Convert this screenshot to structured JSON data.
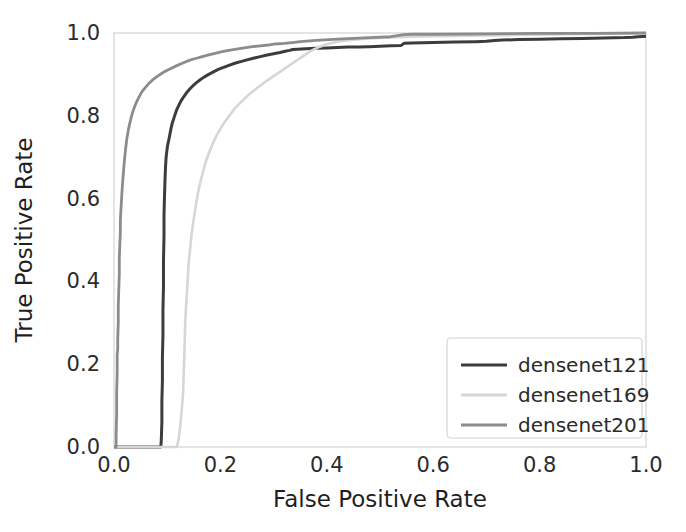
{
  "chart_data": {
    "type": "line",
    "title": "",
    "xlabel": "False Positive Rate",
    "ylabel": "True Positive Rate",
    "xlim": [
      0.0,
      1.0
    ],
    "ylim": [
      0.0,
      1.0
    ],
    "xticks": [
      "0.0",
      "0.2",
      "0.4",
      "0.6",
      "0.8",
      "1.0"
    ],
    "yticks": [
      "0.0",
      "0.2",
      "0.4",
      "0.6",
      "0.8",
      "1.0"
    ],
    "xtick_values": [
      0.0,
      0.2,
      0.4,
      0.6,
      0.8,
      1.0
    ],
    "ytick_values": [
      0.0,
      0.2,
      0.4,
      0.6,
      0.8,
      1.0
    ],
    "grid": false,
    "legend_position": "lower right",
    "series": [
      {
        "name": "densenet121",
        "color": "#3c3c3c",
        "linewidth": 3.0,
        "x": [
          0.0,
          0.088,
          0.089,
          0.09,
          0.09,
          0.091,
          0.091,
          0.092,
          0.092,
          0.093,
          0.093,
          0.094,
          0.094,
          0.095,
          0.096,
          0.097,
          0.098,
          0.099,
          0.1,
          0.101,
          0.103,
          0.105,
          0.107,
          0.109,
          0.112,
          0.115,
          0.118,
          0.122,
          0.126,
          0.131,
          0.136,
          0.142,
          0.148,
          0.155,
          0.162,
          0.17,
          0.178,
          0.187,
          0.196,
          0.206,
          0.216,
          0.227,
          0.238,
          0.25,
          0.262,
          0.275,
          0.288,
          0.3,
          0.312,
          0.322,
          0.33,
          0.336,
          0.345,
          0.36,
          0.38,
          0.4,
          0.42,
          0.44,
          0.46,
          0.48,
          0.5,
          0.52,
          0.54,
          0.545,
          0.56,
          0.6,
          0.64,
          0.68,
          0.7,
          0.715,
          0.73,
          0.76,
          0.8,
          0.84,
          0.88,
          0.92,
          0.96,
          0.975,
          0.985,
          1.0
        ],
        "y": [
          0.0,
          0.0,
          0.02,
          0.06,
          0.11,
          0.16,
          0.215,
          0.27,
          0.33,
          0.39,
          0.45,
          0.51,
          0.56,
          0.61,
          0.65,
          0.68,
          0.7,
          0.712,
          0.722,
          0.73,
          0.742,
          0.755,
          0.768,
          0.78,
          0.792,
          0.804,
          0.815,
          0.826,
          0.836,
          0.846,
          0.855,
          0.864,
          0.872,
          0.88,
          0.887,
          0.894,
          0.9,
          0.906,
          0.912,
          0.917,
          0.922,
          0.927,
          0.931,
          0.935,
          0.939,
          0.943,
          0.947,
          0.95,
          0.953,
          0.956,
          0.958,
          0.96,
          0.961,
          0.962,
          0.963,
          0.964,
          0.965,
          0.966,
          0.966,
          0.967,
          0.968,
          0.969,
          0.97,
          0.975,
          0.976,
          0.977,
          0.978,
          0.979,
          0.98,
          0.982,
          0.983,
          0.984,
          0.985,
          0.986,
          0.987,
          0.988,
          0.989,
          0.99,
          0.991,
          0.992
        ]
      },
      {
        "name": "densenet169",
        "color": "#d6d6d6",
        "linewidth": 2.6,
        "x": [
          0.0,
          0.118,
          0.12,
          0.122,
          0.124,
          0.126,
          0.128,
          0.13,
          0.131,
          0.132,
          0.133,
          0.134,
          0.136,
          0.138,
          0.14,
          0.143,
          0.146,
          0.15,
          0.154,
          0.158,
          0.163,
          0.168,
          0.173,
          0.179,
          0.185,
          0.191,
          0.198,
          0.205,
          0.212,
          0.219,
          0.226,
          0.234,
          0.242,
          0.25,
          0.258,
          0.266,
          0.274,
          0.282,
          0.29,
          0.298,
          0.306,
          0.314,
          0.322,
          0.33,
          0.338,
          0.346,
          0.354,
          0.362,
          0.372,
          0.385,
          0.4,
          0.42,
          0.45,
          0.48,
          0.52,
          0.56,
          0.6,
          0.65,
          0.7,
          0.75,
          0.8,
          0.85,
          0.9,
          0.95,
          1.0
        ],
        "y": [
          0.0,
          0.0,
          0.01,
          0.025,
          0.045,
          0.07,
          0.1,
          0.135,
          0.175,
          0.215,
          0.26,
          0.305,
          0.35,
          0.395,
          0.437,
          0.478,
          0.516,
          0.552,
          0.585,
          0.615,
          0.643,
          0.668,
          0.691,
          0.712,
          0.731,
          0.748,
          0.764,
          0.779,
          0.792,
          0.804,
          0.816,
          0.827,
          0.837,
          0.847,
          0.856,
          0.864,
          0.872,
          0.88,
          0.887,
          0.894,
          0.901,
          0.908,
          0.915,
          0.922,
          0.929,
          0.936,
          0.943,
          0.95,
          0.958,
          0.966,
          0.973,
          0.979,
          0.984,
          0.987,
          0.989,
          0.991,
          0.992,
          0.993,
          0.994,
          0.995,
          0.996,
          0.997,
          0.998,
          0.999,
          1.0
        ]
      },
      {
        "name": "densenet201",
        "color": "#8c8c8c",
        "linewidth": 2.8,
        "x": [
          0.0,
          0.004,
          0.004,
          0.005,
          0.005,
          0.006,
          0.006,
          0.007,
          0.007,
          0.008,
          0.008,
          0.009,
          0.01,
          0.01,
          0.011,
          0.012,
          0.012,
          0.013,
          0.014,
          0.015,
          0.016,
          0.017,
          0.018,
          0.019,
          0.02,
          0.021,
          0.022,
          0.023,
          0.024,
          0.025,
          0.027,
          0.029,
          0.031,
          0.033,
          0.035,
          0.037,
          0.04,
          0.043,
          0.046,
          0.049,
          0.052,
          0.056,
          0.06,
          0.064,
          0.068,
          0.072,
          0.077,
          0.082,
          0.088,
          0.094,
          0.1,
          0.108,
          0.116,
          0.125,
          0.134,
          0.144,
          0.155,
          0.166,
          0.178,
          0.19,
          0.203,
          0.216,
          0.23,
          0.245,
          0.26,
          0.275,
          0.29,
          0.3,
          0.31,
          0.32,
          0.335,
          0.35,
          0.38,
          0.42,
          0.47,
          0.52,
          0.545,
          0.56,
          0.6,
          0.7,
          0.8,
          0.9,
          1.0
        ],
        "y": [
          0.0,
          0.0,
          0.03,
          0.08,
          0.13,
          0.18,
          0.225,
          0.235,
          0.26,
          0.3,
          0.34,
          0.38,
          0.42,
          0.455,
          0.49,
          0.52,
          0.548,
          0.572,
          0.595,
          0.616,
          0.635,
          0.652,
          0.668,
          0.683,
          0.697,
          0.71,
          0.722,
          0.733,
          0.743,
          0.752,
          0.766,
          0.778,
          0.789,
          0.799,
          0.808,
          0.816,
          0.826,
          0.835,
          0.843,
          0.85,
          0.857,
          0.864,
          0.87,
          0.876,
          0.881,
          0.886,
          0.891,
          0.896,
          0.901,
          0.906,
          0.91,
          0.915,
          0.92,
          0.925,
          0.93,
          0.935,
          0.939,
          0.943,
          0.947,
          0.951,
          0.955,
          0.958,
          0.961,
          0.964,
          0.967,
          0.969,
          0.971,
          0.973,
          0.974,
          0.975,
          0.977,
          0.979,
          0.982,
          0.985,
          0.988,
          0.991,
          0.996,
          0.997,
          0.997,
          0.998,
          0.999,
          0.999,
          1.0
        ]
      }
    ]
  },
  "legend": {
    "entries": [
      {
        "label": "densenet121",
        "color": "#3c3c3c"
      },
      {
        "label": "densenet169",
        "color": "#d6d6d6"
      },
      {
        "label": "densenet201",
        "color": "#8c8c8c"
      }
    ]
  },
  "style": {
    "background": "#ffffff",
    "frame_color": "#cfcfcf",
    "text_color": "#2b2b2b"
  }
}
